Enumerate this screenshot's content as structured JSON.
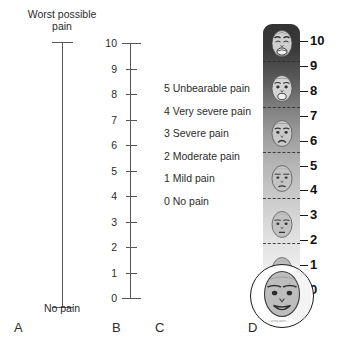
{
  "figure": {
    "background": "#ffffff",
    "panel_letters": [
      {
        "letter": "A",
        "x": 14,
        "y": 320
      },
      {
        "letter": "B",
        "x": 112,
        "y": 320
      },
      {
        "letter": "C",
        "x": 155,
        "y": 320
      },
      {
        "letter": "D",
        "x": 248,
        "y": 320
      }
    ]
  },
  "panel_a": {
    "name": "visual-analogue-scale",
    "top_label": "Worst possible\npain",
    "top_label_line1": "Worst possible",
    "top_label_line2": "pain",
    "bottom_label": "No pain"
  },
  "panel_b": {
    "name": "numeric-rating-scale",
    "ticks": [
      "10",
      "9",
      "8",
      "7",
      "6",
      "5",
      "4",
      "3",
      "2",
      "1",
      "0"
    ],
    "max": 10,
    "min": 0
  },
  "panel_c": {
    "name": "verbal-rating-scale",
    "items": [
      {
        "score": "5",
        "label": "Unbearable pain",
        "text": "5 Unbearable pain"
      },
      {
        "score": "4",
        "label": "Very severe pain",
        "text": "4 Very severe pain"
      },
      {
        "score": "3",
        "label": "Severe pain",
        "text": "3 Severe pain"
      },
      {
        "score": "2",
        "label": "Moderate pain",
        "text": "2 Moderate pain"
      },
      {
        "score": "1",
        "label": "Mild pain",
        "text": "1 Mild pain"
      },
      {
        "score": "0",
        "label": "No pain",
        "text": "0 No pain"
      }
    ]
  },
  "panel_d": {
    "name": "faces-pain-scale",
    "numbers": [
      "10",
      "9",
      "8",
      "7",
      "6",
      "5",
      "4",
      "3",
      "2",
      "1",
      "0"
    ],
    "face_count": 6,
    "faces": [
      {
        "value": "10",
        "expression": "anguished-crying-face"
      },
      {
        "value": "8",
        "expression": "very-distressed-face"
      },
      {
        "value": "6",
        "expression": "distressed-frowning-face"
      },
      {
        "value": "4",
        "expression": "uncomfortable-face"
      },
      {
        "value": "2",
        "expression": "slightly-uncomfortable-face"
      },
      {
        "value": "0",
        "expression": "smiling-face"
      }
    ],
    "magnified_face_value": "0",
    "gradient_top": "#333333",
    "gradient_bottom": "#f7f7f7",
    "attribution": "© Wong-Baker"
  }
}
